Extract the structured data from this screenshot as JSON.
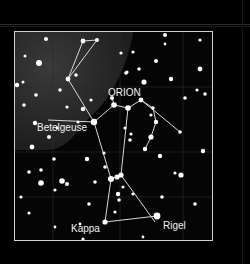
{
  "title": "ORION",
  "labels": {
    "betelgeuse": "Betelgeuse",
    "rigel": "Rigel",
    "kappa": "Kappa"
  },
  "colors": {
    "background": "#000000",
    "sky": "#050505",
    "nebula": "#2b2b2b",
    "frame": "#cfcfcf",
    "lines": "#d8d8d8",
    "stars": "#ffffff"
  }
}
